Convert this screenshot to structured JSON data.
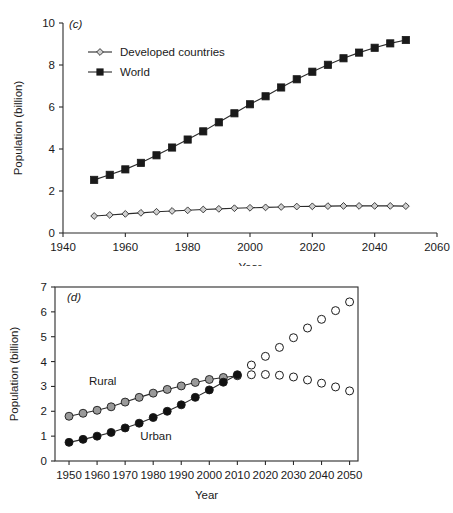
{
  "figure": {
    "panels": [
      "(c)",
      "(d)"
    ]
  },
  "chart_data": [
    {
      "type": "line",
      "panel_label": "(c)",
      "title": "",
      "xlabel": "Year",
      "ylabel": "Population (billion)",
      "xlim": [
        1940,
        2060
      ],
      "ylim": [
        0,
        10
      ],
      "xticks": [
        1940,
        1960,
        1980,
        2000,
        2020,
        2040,
        2060
      ],
      "xticklabels": [
        "1940",
        "1960",
        "1980",
        "2000",
        "2020",
        "2040",
        "2060"
      ],
      "yticks": [
        0,
        2,
        4,
        6,
        8,
        10
      ],
      "yticklabels": [
        "0",
        "2",
        "4",
        "6",
        "8",
        "10"
      ],
      "grid": false,
      "frame": "left-bottom",
      "legend_position": "upper-left",
      "x": [
        1950,
        1955,
        1960,
        1965,
        1970,
        1975,
        1980,
        1985,
        1990,
        1995,
        2000,
        2005,
        2010,
        2015,
        2020,
        2025,
        2030,
        2035,
        2040,
        2045,
        2050
      ],
      "series": [
        {
          "name": "World",
          "marker": "filled-square",
          "color": "#1a1a1a",
          "values": [
            2.53,
            2.77,
            3.03,
            3.34,
            3.7,
            4.07,
            4.45,
            4.84,
            5.27,
            5.7,
            6.13,
            6.51,
            6.93,
            7.32,
            7.68,
            8.01,
            8.32,
            8.59,
            8.82,
            9.03,
            9.19
          ]
        },
        {
          "name": "Developed countries",
          "marker": "open-diamond",
          "color": "#b8b8b8",
          "values": [
            0.81,
            0.86,
            0.91,
            0.96,
            1.01,
            1.05,
            1.08,
            1.12,
            1.15,
            1.18,
            1.2,
            1.22,
            1.24,
            1.26,
            1.27,
            1.28,
            1.29,
            1.29,
            1.29,
            1.29,
            1.28
          ]
        }
      ]
    },
    {
      "type": "scatter",
      "panel_label": "(d)",
      "title": "",
      "xlabel": "Year",
      "ylabel": "Population (billion)",
      "xlim": [
        1945,
        2053
      ],
      "ylim": [
        0,
        7
      ],
      "xticks": [
        1950,
        1960,
        1970,
        1980,
        1990,
        2000,
        2010,
        2020,
        2030,
        2040,
        2050
      ],
      "xticklabels": [
        "1950",
        "1960",
        "1970",
        "1980",
        "1990",
        "2000",
        "2010",
        "2020",
        "2030",
        "2040",
        "2050"
      ],
      "yticks": [
        0,
        1,
        2,
        3,
        4,
        5,
        6,
        7
      ],
      "yticklabels": [
        "0",
        "1",
        "2",
        "3",
        "4",
        "5",
        "6",
        "7"
      ],
      "grid": false,
      "frame": "box",
      "annotations": [
        {
          "text": "Rural",
          "x": 1962,
          "y": 3.05
        },
        {
          "text": "Urban",
          "x": 1981,
          "y": 0.85
        }
      ],
      "x_historical": [
        1950,
        1955,
        1960,
        1965,
        1970,
        1975,
        1980,
        1985,
        1990,
        1995,
        2000,
        2005,
        2010
      ],
      "x_projected": [
        2015,
        2020,
        2025,
        2030,
        2035,
        2040,
        2045,
        2050
      ],
      "series": [
        {
          "name": "Rural",
          "marker": "filled-circle",
          "color": "#9a9a9a",
          "historical": [
            1.8,
            1.92,
            2.04,
            2.18,
            2.37,
            2.56,
            2.73,
            2.88,
            3.02,
            3.16,
            3.28,
            3.36,
            3.43
          ],
          "projected": [
            3.47,
            3.48,
            3.45,
            3.38,
            3.26,
            3.13,
            2.98,
            2.82
          ],
          "projected_marker": "open-circle"
        },
        {
          "name": "Urban",
          "marker": "filled-circle",
          "color": "#111111",
          "historical": [
            0.75,
            0.87,
            1.0,
            1.15,
            1.33,
            1.52,
            1.75,
            2.0,
            2.26,
            2.56,
            2.86,
            3.17,
            3.47
          ],
          "projected": [
            3.86,
            4.21,
            4.57,
            4.96,
            5.35,
            5.7,
            6.05,
            6.4
          ],
          "projected_marker": "open-circle"
        }
      ]
    }
  ]
}
